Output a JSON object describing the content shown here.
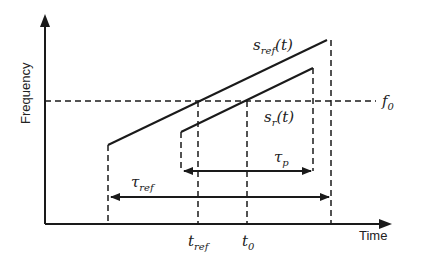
{
  "axes": {
    "x_label": "Time",
    "y_label": "Frequency"
  },
  "signals": {
    "reference": {
      "symbol": "s",
      "subscript": "ref",
      "suffix": "(t)"
    },
    "received": {
      "symbol": "s",
      "subscript": "r",
      "suffix": "(t)"
    }
  },
  "levels": {
    "f0": {
      "symbol": "f",
      "subscript": "0"
    }
  },
  "time_marks": {
    "t_ref": {
      "symbol": "t",
      "subscript": "ref"
    },
    "t_0": {
      "symbol": "t",
      "subscript": "0"
    }
  },
  "durations": {
    "tau_ref": {
      "symbol": "τ",
      "subscript": "ref"
    },
    "tau_p": {
      "symbol": "τ",
      "subscript": "p"
    }
  },
  "colors": {
    "stroke": "#1a1a1a",
    "text": "#222222",
    "background": "#ffffff"
  }
}
